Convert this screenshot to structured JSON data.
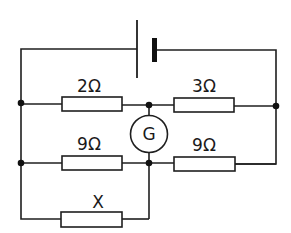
{
  "diagram": {
    "colors": {
      "line": "#1f1f1f",
      "background": "#ffffff"
    },
    "battery": {
      "label": ""
    },
    "resistors": [
      {
        "id": "r-top-left",
        "label": "2Ω"
      },
      {
        "id": "r-top-right",
        "label": "3Ω"
      },
      {
        "id": "r-mid-left",
        "label": "9Ω"
      },
      {
        "id": "r-mid-right",
        "label": "9Ω"
      },
      {
        "id": "r-bottom",
        "label": "X"
      }
    ],
    "galvanometer": {
      "label": "G"
    }
  }
}
